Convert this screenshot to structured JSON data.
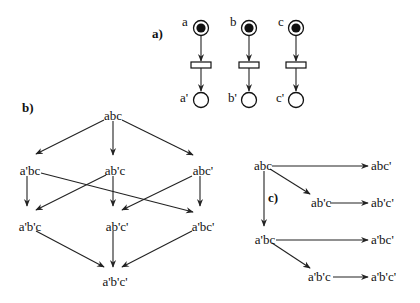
{
  "parts": {
    "a": {
      "label": "a)",
      "places_in": [
        {
          "name": "a",
          "marked": true
        },
        {
          "name": "b",
          "marked": true
        },
        {
          "name": "c",
          "marked": true
        }
      ],
      "places_out": [
        {
          "name": "a'",
          "marked": false
        },
        {
          "name": "b'",
          "marked": false
        },
        {
          "name": "c'",
          "marked": false
        }
      ]
    },
    "b": {
      "label": "b)",
      "nodes": {
        "n0": "abc",
        "n1": "a'bc",
        "n2": "ab'c",
        "n3": "abc'",
        "n4": "a'b'c",
        "n5": "ab'c'",
        "n6": "a'bc'",
        "n7": "a'b'c'"
      }
    },
    "c": {
      "label": "c)",
      "nodes": {
        "n0": "abc",
        "n1": "abc'",
        "n2": "ab'c",
        "n3": "ab'c'",
        "n4": "a'bc",
        "n5": "a'bc'",
        "n6": "a'b'c",
        "n7": "a'b'c'"
      }
    }
  },
  "colors": {
    "ink": "#111111",
    "background": "#ffffff"
  }
}
